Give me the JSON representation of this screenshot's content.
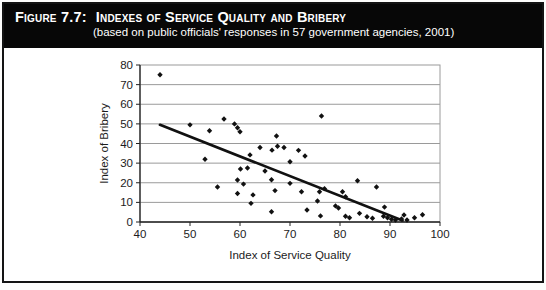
{
  "figure": {
    "label": "Figure 7.7:",
    "title": "Indexes of Service Quality and Bribery",
    "subtitle": "(based on public officials' responses in 57 government agencies, 2001)"
  },
  "colors": {
    "header_bg": "#070707",
    "header_text": "#ffffff",
    "grid": "#9a9a9a",
    "axis": "#222222",
    "marker": "#111111",
    "trendline": "#111111"
  },
  "chart_data": {
    "type": "scatter",
    "subtitle": "(based on public officials' responses in 57 government agencies, 2001)",
    "xlabel": "Index of Service Quality",
    "ylabel": "Index of Bribery",
    "xlim": [
      40,
      100
    ],
    "ylim": [
      0,
      80
    ],
    "xticks": [
      40,
      50,
      60,
      70,
      80,
      90,
      100
    ],
    "yticks": [
      0,
      10,
      20,
      30,
      40,
      50,
      60,
      70,
      80
    ],
    "grid": "horizontal",
    "legend": "none",
    "marker": "diamond",
    "points": [
      [
        44,
        75
      ],
      [
        50,
        49.5
      ],
      [
        53.9,
        46.5
      ],
      [
        56.8,
        52.5
      ],
      [
        58.9,
        50
      ],
      [
        59.5,
        48
      ],
      [
        60,
        46
      ],
      [
        67.3,
        43.8
      ],
      [
        76.3,
        54
      ],
      [
        53,
        32
      ],
      [
        55.5,
        17.8
      ],
      [
        59.5,
        21.4
      ],
      [
        60.1,
        27
      ],
      [
        60.7,
        19.3
      ],
      [
        61.5,
        27.5
      ],
      [
        62,
        34.2
      ],
      [
        59.5,
        14.5
      ],
      [
        62.6,
        13.8
      ],
      [
        62.2,
        9.5
      ],
      [
        64,
        38
      ],
      [
        65,
        26
      ],
      [
        66.3,
        21.5
      ],
      [
        66.4,
        36.6
      ],
      [
        67.5,
        38.6
      ],
      [
        68.8,
        38
      ],
      [
        67,
        16
      ],
      [
        66.3,
        5.2
      ],
      [
        70,
        30.7
      ],
      [
        70,
        19.7
      ],
      [
        71.7,
        36.5
      ],
      [
        72.3,
        15.4
      ],
      [
        73,
        33.6
      ],
      [
        73.4,
        6.1
      ],
      [
        75.5,
        10.7
      ],
      [
        75.9,
        15.4
      ],
      [
        76.1,
        3.1
      ],
      [
        76.9,
        17
      ],
      [
        79.1,
        8.2
      ],
      [
        79.7,
        7.1
      ],
      [
        80.5,
        15.4
      ],
      [
        81.1,
        12.9
      ],
      [
        81.1,
        2.9
      ],
      [
        81.9,
        2.2
      ],
      [
        83.5,
        21
      ],
      [
        83.9,
        4.4
      ],
      [
        85.4,
        2.7
      ],
      [
        86.5,
        1.9
      ],
      [
        87.3,
        17.8
      ],
      [
        88.9,
        7.6
      ],
      [
        88.7,
        2.9
      ],
      [
        89.5,
        2.2
      ],
      [
        90.3,
        1.4
      ],
      [
        91.1,
        1
      ],
      [
        92.3,
        1.5
      ],
      [
        92.8,
        3.6
      ],
      [
        93.4,
        1
      ],
      [
        94.9,
        2.2
      ],
      [
        96.5,
        3.7
      ]
    ],
    "trendline": {
      "x1": 44,
      "y1": 49.5,
      "x2": 92.5,
      "y2": 0.8
    }
  }
}
